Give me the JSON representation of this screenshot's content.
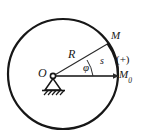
{
  "figure": {
    "kind": "mechanics-diagram",
    "background_color": "#ffffff",
    "stroke_color": "#171717",
    "labels": {
      "origin": "O",
      "radius": "R",
      "angle": "φ",
      "arc_length": "s",
      "point_m": "M",
      "positive_direction": "(+)",
      "reference_point_base": "M",
      "reference_point_sub": "0"
    },
    "geometry": {
      "circle_center_x": 63,
      "circle_center_y": 74,
      "circle_radius": 55,
      "pivot_x": 53,
      "pivot_y": 76,
      "point_m_x": 108,
      "point_m_y": 44,
      "point_m0_x": 119,
      "point_m0_y": 76,
      "angle_degrees": 30
    }
  }
}
